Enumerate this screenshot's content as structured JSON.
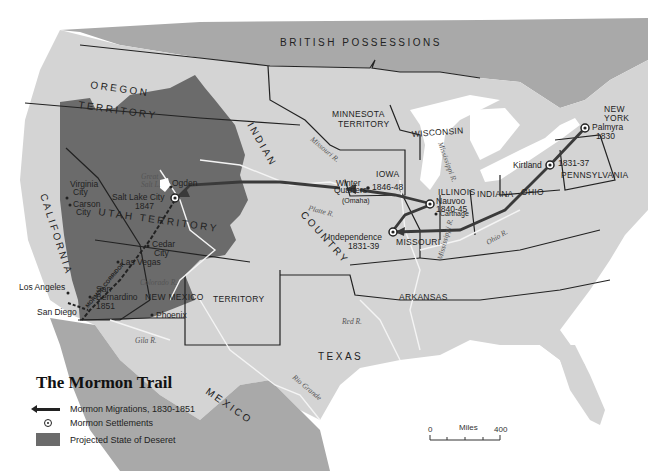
{
  "title": "The Mormon Trail",
  "legend": {
    "items": [
      {
        "symbol": "arrow",
        "label": "Mormon Migrations, 1830-1851"
      },
      {
        "symbol": "settlement-dot",
        "label": "Mormon Settlements"
      },
      {
        "symbol": "gray-fill",
        "label": "Projected State of Deseret"
      }
    ]
  },
  "scale_bar": {
    "start": "0",
    "unit": "Miles",
    "end": "400"
  },
  "regions": {
    "british_possessions": "BRITISH   POSSESSIONS",
    "oregon": "OREGON",
    "oregon_territory": "TERRITORY",
    "california": "CALIFORNIA",
    "utah_territory": "UTAH TERRITORY",
    "new_mexico": "NEW MEXICO",
    "new_mexico_territory": "TERRITORY",
    "indian": "INDIAN",
    "country": "COUNTRY",
    "texas": "TEXAS",
    "mexico": "MEXICO",
    "minnesota": "MINNESOTA",
    "minnesota_territory": "TERRITORY",
    "wisconsin": "WISCONSIN",
    "iowa": "IOWA",
    "illinois": "ILLINOIS",
    "indiana": "INDIANA",
    "ohio": "OHIO",
    "missouri": "MISSOURI",
    "arkansas": "ARKANSAS",
    "pennsylvania": "PENNSYLVANIA",
    "new_york_1": "NEW",
    "new_york_2": "YORK",
    "mormon_corridor": "MORMON CORRIDOR"
  },
  "rivers": {
    "missouri": "Missouri R.",
    "mississippi_north": "Mississippi R.",
    "mississippi_south": "Mississippi R.",
    "platte": "Platte R.",
    "red": "Red R.",
    "rio_grande": "Rio Grande",
    "colorado": "Colorado R.",
    "gila": "Gila R.",
    "ohio": "Ohio R.",
    "great_salt_lake_1": "Great",
    "great_salt_lake_2": "Salt L."
  },
  "settlements": [
    {
      "name": "Palmyra",
      "year": "1830"
    },
    {
      "name": "Kirtland",
      "year": "1831-37"
    },
    {
      "name": "Independence",
      "year": "1831-39"
    },
    {
      "name": "Nauvoo",
      "year": "1840-45"
    },
    {
      "name_1": "Winter",
      "name_2": "Quarters",
      "year": "1846-48",
      "note": "(Omaha)"
    },
    {
      "name": "Salt Lake City",
      "year": "1847"
    },
    {
      "name_1": "San",
      "name_2": "Bernardino",
      "year": "1851"
    }
  ],
  "cities": {
    "carthage": "Carthage",
    "ogden": "Ogden",
    "virginia_city_1": "Virginia",
    "virginia_city_2": "City",
    "carson_city_1": "Carson",
    "carson_city_2": "City",
    "cedar_city_1": "Cedar",
    "cedar_city_2": "City",
    "las_vegas": "Las Vegas",
    "los_angeles": "Los Angeles",
    "san_diego": "San Diego",
    "phoenix": "Phoenix"
  },
  "colors": {
    "land": "#d4d4d4",
    "deseret": "#6b6b6b",
    "foreign": "#a9a9a9",
    "water": "#ffffff",
    "route": "#3a3a3a"
  }
}
